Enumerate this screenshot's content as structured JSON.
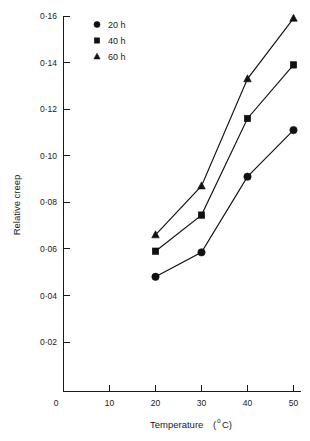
{
  "chart_data": {
    "type": "line",
    "title": "",
    "xlabel": "Temperature (°C)",
    "ylabel": "Relative  creep",
    "x": [
      20,
      30,
      40,
      50
    ],
    "xlim": [
      0,
      50
    ],
    "ylim": [
      0,
      0.16
    ],
    "grid": false,
    "legend_position": "top-left",
    "x_tick_labels": [
      "0",
      "10",
      "20",
      "30",
      "40",
      "50"
    ],
    "x_tick_values": [
      0,
      10,
      20,
      30,
      40,
      50
    ],
    "y_tick_labels": [
      "0·02",
      "0·04",
      "0·06",
      "0·08",
      "0·10",
      "0·12",
      "0·14",
      "0·16"
    ],
    "y_tick_values": [
      0.02,
      0.04,
      0.06,
      0.08,
      0.1,
      0.12,
      0.14,
      0.16
    ],
    "series": [
      {
        "name": "20 h",
        "marker": "circle",
        "color": "#111111",
        "values": [
          0.048,
          0.0585,
          0.091,
          0.111
        ]
      },
      {
        "name": "40 h",
        "marker": "square",
        "color": "#111111",
        "values": [
          0.059,
          0.0745,
          0.116,
          0.139
        ]
      },
      {
        "name": "60 h",
        "marker": "triangle",
        "color": "#111111",
        "values": [
          0.066,
          0.087,
          0.133,
          0.159
        ]
      }
    ]
  },
  "axes": {
    "x_axis_title": "Temperature",
    "x_axis_unit_prefix": "(",
    "x_axis_unit_deg": "o",
    "x_axis_unit_suffix": "C)",
    "y_axis_title": "Relative  creep",
    "origin_label": "0"
  },
  "legend": {
    "entries": [
      {
        "marker": "circle",
        "label": "20 h"
      },
      {
        "marker": "square",
        "label": "40 h"
      },
      {
        "marker": "triangle",
        "label": "60 h"
      }
    ]
  }
}
